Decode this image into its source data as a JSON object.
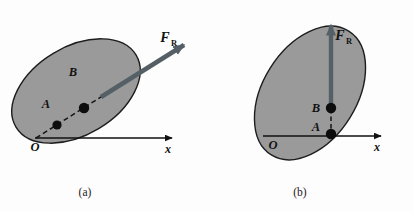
{
  "figure": {
    "background_color": "#fdfdfd",
    "panels": [
      {
        "id": "panel-a",
        "caption": "(a)",
        "body_color": "#9a9a9a",
        "body_outline_color": "#1d1d1d",
        "arrow_color": "#555f66",
        "axis_color": "#111111",
        "point_color": "#0d0d0d",
        "labels": {
          "point_a": "A",
          "point_b": "B",
          "origin": "O",
          "axis_x": "x",
          "force": "F",
          "force_subscript": "R"
        },
        "description": "Tilted elliptical body with resultant force F_R acting along an inclined line of action passing through points A and B; horizontal x axis from origin O."
      },
      {
        "id": "panel-b",
        "caption": "(b)",
        "body_color": "#9a9a9a",
        "body_outline_color": "#1d1d1d",
        "arrow_color": "#555f66",
        "axis_color": "#111111",
        "point_color": "#0d0d0d",
        "labels": {
          "point_a": "A",
          "point_b": "B",
          "origin": "O",
          "axis_x": "x",
          "force": "F",
          "force_subscript": "R"
        },
        "description": "Tilted elliptical body with resultant force F_R acting vertically upward along a line through points A and B; horizontal x axis from origin O."
      }
    ]
  }
}
